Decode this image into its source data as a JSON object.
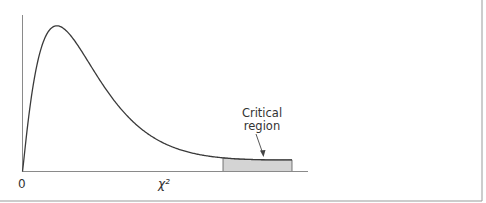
{
  "chart_data": {
    "type": "area",
    "title": "",
    "xlabel": "χ²",
    "x_tick_labels": [
      "0"
    ],
    "annotation": {
      "text_line1": "Critical",
      "text_line2": "region"
    },
    "distribution": "chi-square",
    "critical_region_side": "right-tail",
    "colors": {
      "curve": "#3a3a3a",
      "axis": "#8a8a8a",
      "shade": "#d4d4d4",
      "border": "#9a9a9a"
    }
  }
}
